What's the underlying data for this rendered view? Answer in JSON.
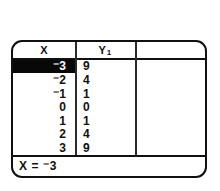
{
  "screen": {
    "device": "graphing-calculator-table-screen",
    "columns": [
      {
        "key": "x",
        "header": "X",
        "header_sub": ""
      },
      {
        "key": "y1",
        "header": "Y",
        "header_sub": "1"
      },
      {
        "key": "empty",
        "header": "",
        "header_sub": ""
      }
    ],
    "rows": [
      {
        "x": "⁻3",
        "y1": "9",
        "selected": true
      },
      {
        "x": "⁻2",
        "y1": "4",
        "selected": false
      },
      {
        "x": "⁻1",
        "y1": "1",
        "selected": false
      },
      {
        "x": "0",
        "y1": "0",
        "selected": false
      },
      {
        "x": "1",
        "y1": "1",
        "selected": false
      },
      {
        "x": "2",
        "y1": "4",
        "selected": false
      },
      {
        "x": "3",
        "y1": "9",
        "selected": false
      }
    ],
    "status": {
      "text": "X = ⁻3"
    },
    "colors": {
      "frame": "#101010",
      "background": "#ffffff",
      "text": "#111111",
      "highlight_bg": "#080808",
      "highlight_text": "#ffffff",
      "divider": "#2a2a2a"
    }
  },
  "chart_data": {
    "type": "table",
    "title": "",
    "columns": [
      "X",
      "Y1"
    ],
    "x": [
      -3,
      -2,
      -1,
      0,
      1,
      2,
      3
    ],
    "series": [
      {
        "name": "Y1",
        "values": [
          9,
          4,
          1,
          0,
          1,
          4,
          9
        ]
      }
    ],
    "selected_row_index": 0,
    "selected_x": -3,
    "relation": "Y1 = X^2"
  }
}
